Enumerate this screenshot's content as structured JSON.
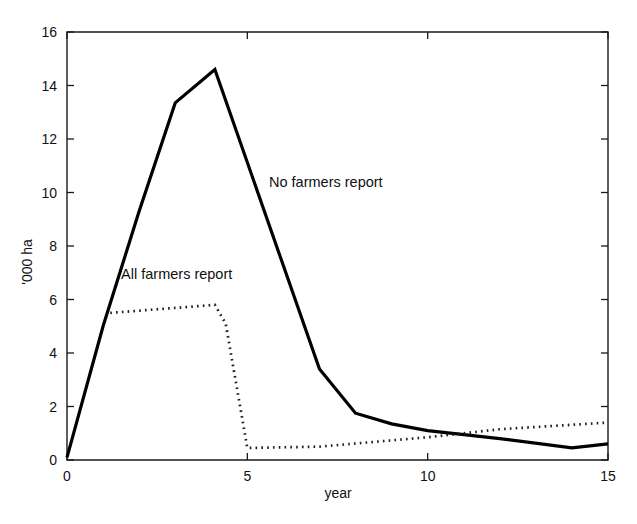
{
  "chart_data": {
    "type": "line",
    "title": "",
    "xlabel": "year",
    "ylabel": "'000 ha",
    "xlim": [
      0,
      15
    ],
    "ylim": [
      0,
      16
    ],
    "xticks": [
      0,
      5,
      10,
      15
    ],
    "yticks": [
      0,
      2,
      4,
      6,
      8,
      10,
      12,
      14,
      16
    ],
    "xtick_labels": [
      "0",
      "5",
      "10",
      "15"
    ],
    "ytick_labels": [
      "0",
      "2",
      "4",
      "6",
      "8",
      "10",
      "12",
      "14",
      "16"
    ],
    "grid": false,
    "legend_position": "inline-annotations",
    "series": [
      {
        "name": "No farmers report",
        "style": "solid",
        "color": "#000000",
        "points": [
          [
            0.0,
            0.1
          ],
          [
            1.0,
            5.0
          ],
          [
            2.0,
            9.3
          ],
          [
            3.0,
            13.35
          ],
          [
            4.1,
            14.6
          ],
          [
            7.0,
            3.4
          ],
          [
            8.0,
            1.75
          ],
          [
            9.0,
            1.35
          ],
          [
            10.0,
            1.1
          ],
          [
            11.0,
            0.95
          ],
          [
            12.0,
            0.8
          ],
          [
            14.0,
            0.45
          ],
          [
            15.0,
            0.6
          ]
        ]
      },
      {
        "name": "All farmers report",
        "style": "dotted",
        "color": "#1c1c1c",
        "points": [
          [
            1.2,
            5.5
          ],
          [
            4.1,
            5.8
          ],
          [
            4.4,
            5.1
          ],
          [
            5.0,
            0.45
          ],
          [
            7.0,
            0.5
          ],
          [
            10.0,
            0.85
          ],
          [
            12.0,
            1.15
          ],
          [
            15.0,
            1.4
          ]
        ]
      }
    ],
    "annotations": [
      {
        "text": "No farmers report",
        "x": 5.6,
        "y": 10.2
      },
      {
        "text": "All farmers report",
        "x": 1.5,
        "y": 6.75
      }
    ]
  }
}
